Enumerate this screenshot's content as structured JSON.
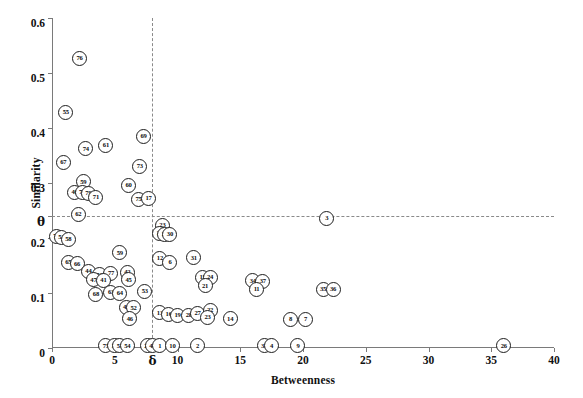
{
  "chart_data": {
    "type": "scatter",
    "title": "",
    "xlabel": "Betweenness",
    "ylabel": "Similarity",
    "xlim": [
      0,
      40
    ],
    "ylim": [
      0,
      0.6
    ],
    "grid": false,
    "legend": null,
    "xticks": [
      {
        "value": 0,
        "label": "0"
      },
      {
        "value": 5,
        "label": "5"
      },
      {
        "value": 8,
        "label": "δ"
      },
      {
        "value": 10,
        "label": "10"
      },
      {
        "value": 15,
        "label": "15"
      },
      {
        "value": 20,
        "label": "20"
      },
      {
        "value": 25,
        "label": "25"
      },
      {
        "value": 30,
        "label": "30"
      },
      {
        "value": 35,
        "label": "35"
      },
      {
        "value": 40,
        "label": "40"
      }
    ],
    "yticks": [
      {
        "value": 0,
        "label": "0"
      },
      {
        "value": 0.1,
        "label": "0.1"
      },
      {
        "value": 0.2,
        "label": "0.2"
      },
      {
        "value": 0.24,
        "label": "θ"
      },
      {
        "value": 0.3,
        "label": "0.3"
      },
      {
        "value": 0.4,
        "label": "0.4"
      },
      {
        "value": 0.5,
        "label": "0.5"
      },
      {
        "value": 0.6,
        "label": "0.6"
      }
    ],
    "annotations": [
      {
        "name": "theta-threshold-line",
        "type": "hline",
        "y": 0.24,
        "style": "dashed"
      },
      {
        "name": "delta-threshold-line",
        "type": "vline",
        "x": 8.0,
        "style": "dashed"
      }
    ],
    "points": [
      {
        "label": "76",
        "x": 2.2,
        "y": 0.527
      },
      {
        "label": "55",
        "x": 1.1,
        "y": 0.429
      },
      {
        "label": "69",
        "x": 7.3,
        "y": 0.385
      },
      {
        "label": "61",
        "x": 4.3,
        "y": 0.368
      },
      {
        "label": "74",
        "x": 2.7,
        "y": 0.362
      },
      {
        "label": "67",
        "x": 0.9,
        "y": 0.338
      },
      {
        "label": "73",
        "x": 7.0,
        "y": 0.33
      },
      {
        "label": "59",
        "x": 2.5,
        "y": 0.302
      },
      {
        "label": "60",
        "x": 6.1,
        "y": 0.295
      },
      {
        "label": "40",
        "x": 1.8,
        "y": 0.283
      },
      {
        "label": "72",
        "x": 2.4,
        "y": 0.283
      },
      {
        "label": "79",
        "x": 2.9,
        "y": 0.281
      },
      {
        "label": "71",
        "x": 3.5,
        "y": 0.274
      },
      {
        "label": "75",
        "x": 6.9,
        "y": 0.27
      },
      {
        "label": "17",
        "x": 7.7,
        "y": 0.272
      },
      {
        "label": "62",
        "x": 2.1,
        "y": 0.243
      },
      {
        "label": "3",
        "x": 21.9,
        "y": 0.236
      },
      {
        "label": "23",
        "x": 8.8,
        "y": 0.223
      },
      {
        "label": "29",
        "x": 8.6,
        "y": 0.208
      },
      {
        "label": "27",
        "x": 9.0,
        "y": 0.207
      },
      {
        "label": "30",
        "x": 9.4,
        "y": 0.206
      },
      {
        "label": "70",
        "x": 0.35,
        "y": 0.203
      },
      {
        "label": "53",
        "x": 0.75,
        "y": 0.201
      },
      {
        "label": "58",
        "x": 1.3,
        "y": 0.197
      },
      {
        "label": "59",
        "x": 5.4,
        "y": 0.173
      },
      {
        "label": "12",
        "x": 8.6,
        "y": 0.163
      },
      {
        "label": "6",
        "x": 9.4,
        "y": 0.156
      },
      {
        "label": "31",
        "x": 11.3,
        "y": 0.164
      },
      {
        "label": "65",
        "x": 1.3,
        "y": 0.156
      },
      {
        "label": "66",
        "x": 2.0,
        "y": 0.153
      },
      {
        "label": "44",
        "x": 2.9,
        "y": 0.14
      },
      {
        "label": "56",
        "x": 3.8,
        "y": 0.133
      },
      {
        "label": "77",
        "x": 4.7,
        "y": 0.135
      },
      {
        "label": "42",
        "x": 6.0,
        "y": 0.137
      },
      {
        "label": "45",
        "x": 6.1,
        "y": 0.124
      },
      {
        "label": "15",
        "x": 12.0,
        "y": 0.128
      },
      {
        "label": "24",
        "x": 12.6,
        "y": 0.129
      },
      {
        "label": "34",
        "x": 16.0,
        "y": 0.122
      },
      {
        "label": "37",
        "x": 16.8,
        "y": 0.121
      },
      {
        "label": "47",
        "x": 3.3,
        "y": 0.124
      },
      {
        "label": "41",
        "x": 4.1,
        "y": 0.123
      },
      {
        "label": "21",
        "x": 12.2,
        "y": 0.113
      },
      {
        "label": "11",
        "x": 16.3,
        "y": 0.106
      },
      {
        "label": "35",
        "x": 21.6,
        "y": 0.107
      },
      {
        "label": "36",
        "x": 22.4,
        "y": 0.106
      },
      {
        "label": "68",
        "x": 3.5,
        "y": 0.097
      },
      {
        "label": "63",
        "x": 4.7,
        "y": 0.101
      },
      {
        "label": "64",
        "x": 5.4,
        "y": 0.1
      },
      {
        "label": "53",
        "x": 7.4,
        "y": 0.103
      },
      {
        "label": "43",
        "x": 5.9,
        "y": 0.074
      },
      {
        "label": "52",
        "x": 6.5,
        "y": 0.073
      },
      {
        "label": "13",
        "x": 8.6,
        "y": 0.064
      },
      {
        "label": "16",
        "x": 9.3,
        "y": 0.061
      },
      {
        "label": "19",
        "x": 10.0,
        "y": 0.059
      },
      {
        "label": "28",
        "x": 10.9,
        "y": 0.06
      },
      {
        "label": "27",
        "x": 11.6,
        "y": 0.063
      },
      {
        "label": "22",
        "x": 12.6,
        "y": 0.068
      },
      {
        "label": "23",
        "x": 12.4,
        "y": 0.056
      },
      {
        "label": "46",
        "x": 6.2,
        "y": 0.053
      },
      {
        "label": "14",
        "x": 14.2,
        "y": 0.053
      },
      {
        "label": "8",
        "x": 19.0,
        "y": 0.052
      },
      {
        "label": "7",
        "x": 20.2,
        "y": 0.052
      },
      {
        "label": "75",
        "x": 4.3,
        "y": 0.004
      },
      {
        "label": "39",
        "x": 5.0,
        "y": 0.004
      },
      {
        "label": "51",
        "x": 5.4,
        "y": 0.004
      },
      {
        "label": "54",
        "x": 6.0,
        "y": 0.004
      },
      {
        "label": "20",
        "x": 7.6,
        "y": 0.004
      },
      {
        "label": "48",
        "x": 8.0,
        "y": 0.004
      },
      {
        "label": "1",
        "x": 8.6,
        "y": 0.004
      },
      {
        "label": "10",
        "x": 9.6,
        "y": 0.004
      },
      {
        "label": "2",
        "x": 11.6,
        "y": 0.004
      },
      {
        "label": "33",
        "x": 16.9,
        "y": 0.004
      },
      {
        "label": "4",
        "x": 17.5,
        "y": 0.004
      },
      {
        "label": "9",
        "x": 19.6,
        "y": 0.004
      },
      {
        "label": "26",
        "x": 36.0,
        "y": 0.004
      }
    ]
  }
}
